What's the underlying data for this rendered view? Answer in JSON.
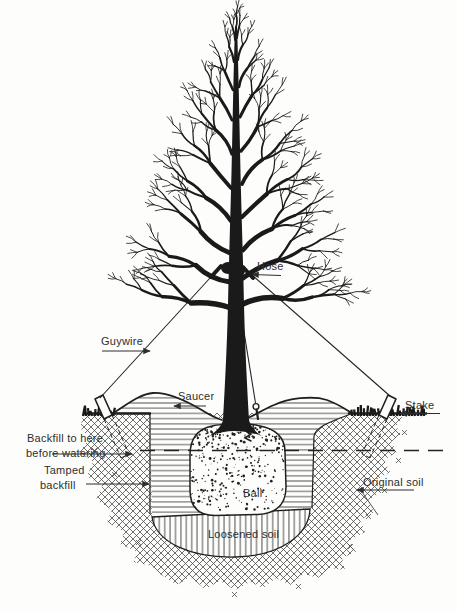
{
  "figure": {
    "type": "technical line illustration",
    "ink_color": "#1f1f1f",
    "paper_color": "#fdfdfb",
    "hatch_legend": {
      "crosshatch": "original undisturbed soil",
      "horizontal_lines": "backfill",
      "vertical_lines": "loosened soil",
      "stipple": "root ball"
    }
  },
  "labels": {
    "hose": "Hose",
    "guywire": "Guywire",
    "saucer": "Saucer",
    "stake": "Stake",
    "backfill_note_line1": "Backfill to here",
    "backfill_note_line2": "before watering",
    "tamped_line1": "Tamped",
    "tamped_line2": "backfill",
    "ball": "Ball",
    "original_soil": "Original soil",
    "loosened_soil": "Loosened soil"
  }
}
